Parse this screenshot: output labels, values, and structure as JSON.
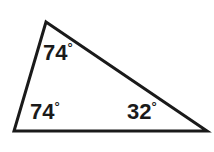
{
  "figure": {
    "kind": "triangle-angle-diagram",
    "background_color": "#ffffff",
    "stroke_color": "#1a1a1a",
    "stroke_width": 3,
    "text_color": "#1a1a1a",
    "degree_symbol": "°",
    "vertices": {
      "apex": {
        "x": 46,
        "y": 22
      },
      "bottom_left": {
        "x": 14,
        "y": 131
      },
      "bottom_right": {
        "x": 207,
        "y": 131
      }
    },
    "angles": [
      {
        "id": "apex",
        "value": "74",
        "unit": "°",
        "text": "74°",
        "at_vertex": "apex"
      },
      {
        "id": "bottom-left",
        "value": "74",
        "unit": "°",
        "text": "74°",
        "at_vertex": "bottom_left"
      },
      {
        "id": "bottom-right",
        "value": "32",
        "unit": "°",
        "text": "32°",
        "at_vertex": "bottom_right"
      }
    ]
  },
  "chart_data": {
    "type": "diagram",
    "title": "",
    "subtitle": "",
    "xlabel": "",
    "ylabel": "",
    "shape": "triangle",
    "annotations": [
      "74°",
      "74°",
      "32°"
    ],
    "values": [
      74,
      74,
      32
    ],
    "categories": [
      "apex angle",
      "bottom-left angle",
      "bottom-right angle"
    ],
    "angle_sum": 180,
    "grid": false,
    "legend": "none"
  }
}
